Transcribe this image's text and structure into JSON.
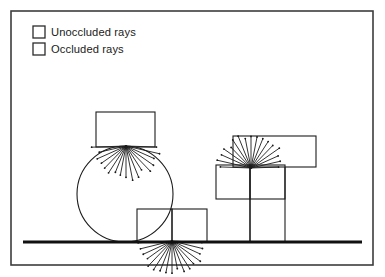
{
  "figure": {
    "background_color": "#ffffff",
    "frame": {
      "name": "figure-border",
      "stroke_color": "#3d3d3d",
      "stroke_width": 1.6,
      "x": 11,
      "y": 11,
      "width": 362,
      "height": 254
    },
    "ground": {
      "name": "ground-line",
      "stroke_color": "#111111",
      "stroke_width": 3.2,
      "x1": 23,
      "y1": 242,
      "x2": 362,
      "y2": 242
    }
  },
  "legend": {
    "name": "legend",
    "swatch_fill": "#ffffff",
    "swatch_stroke": "#2b2b2b",
    "text_color": "#1a1a1a",
    "items": [
      {
        "key": "unoccluded",
        "label": "Unoccluded rays",
        "swatch_x": 33,
        "swatch_y": 26,
        "swatch_size": 12,
        "label_x": 51,
        "label_y": 36
      },
      {
        "key": "occluded",
        "label": "Occluded rays",
        "swatch_x": 33,
        "swatch_y": 43,
        "swatch_size": 12,
        "label_x": 51,
        "label_y": 53
      }
    ]
  },
  "scene": {
    "stroke_color": "#1c1c1c",
    "shape_stroke_width": 1.1,
    "ray_stroke_width": 0.9,
    "ray_dot_radius": 0.9,
    "shapes": [
      {
        "name": "circle-occluder",
        "type": "circle",
        "cx": 125,
        "cy": 194,
        "r": 48
      },
      {
        "name": "box-top-left",
        "type": "rect",
        "x": 96,
        "y": 112,
        "width": 59,
        "height": 35
      },
      {
        "name": "box-bottom-left",
        "type": "rect",
        "x": 137,
        "y": 209,
        "width": 35,
        "height": 33
      },
      {
        "name": "box-bottom-right",
        "type": "rect",
        "x": 172,
        "y": 209,
        "width": 35,
        "height": 33
      },
      {
        "name": "box-right-upper",
        "type": "rect",
        "x": 233,
        "y": 136,
        "width": 83,
        "height": 31
      },
      {
        "name": "box-right-mid-left",
        "type": "rect",
        "x": 216,
        "y": 165,
        "width": 34,
        "height": 34
      },
      {
        "name": "box-right-mid-right",
        "type": "rect",
        "x": 250,
        "y": 165,
        "width": 35,
        "height": 34
      },
      {
        "name": "pillar-left-edge",
        "type": "line",
        "x1": 250,
        "y1": 167,
        "x2": 250,
        "y2": 242
      },
      {
        "name": "pillar-right-edge",
        "type": "line",
        "x1": 285,
        "y1": 167,
        "x2": 285,
        "y2": 242
      },
      {
        "name": "pillar-inner-edge",
        "type": "line",
        "x1": 250,
        "y1": 199,
        "x2": 250,
        "y2": 242
      }
    ],
    "ray_fans": [
      {
        "name": "ray-fan-top",
        "origin_x": 126,
        "origin_y": 146,
        "start_angle_deg": 182,
        "end_angle_deg": 358,
        "count": 17,
        "length": 31,
        "length_jitter": 4
      },
      {
        "name": "ray-fan-bottom",
        "origin_x": 172,
        "origin_y": 241,
        "start_angle_deg": 183,
        "end_angle_deg": 357,
        "count": 17,
        "length": 32,
        "length_jitter": 4
      },
      {
        "name": "ray-fan-right",
        "origin_x": 251,
        "origin_y": 168,
        "start_angle_deg": 2,
        "end_angle_deg": 178,
        "count": 17,
        "length": 31,
        "length_jitter": 4
      }
    ]
  }
}
